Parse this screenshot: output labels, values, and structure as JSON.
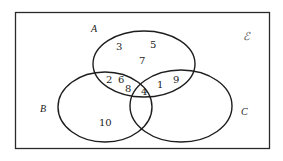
{
  "diagram": {
    "type": "venn",
    "universal_set": {
      "symbol": "ℰ",
      "members": [
        "1",
        "2",
        "3",
        "4",
        "5",
        "6",
        "7",
        "8",
        "9",
        "10"
      ]
    },
    "sets": {
      "A": {
        "label": "A"
      },
      "B": {
        "label": "B"
      },
      "C": {
        "label": "C"
      }
    },
    "regions": {
      "A_only": [
        "3",
        "5",
        "7"
      ],
      "A_and_B_only": [
        "2",
        "6",
        "8"
      ],
      "A_and_B_and_C": [
        "4"
      ],
      "A_and_C_only": [
        "1",
        "9"
      ],
      "B_only": [
        "10"
      ],
      "C_only": [],
      "B_and_C_only": [],
      "outside": []
    },
    "colors": {
      "stroke": "#1e1e1e",
      "background": "#ffffff"
    }
  }
}
